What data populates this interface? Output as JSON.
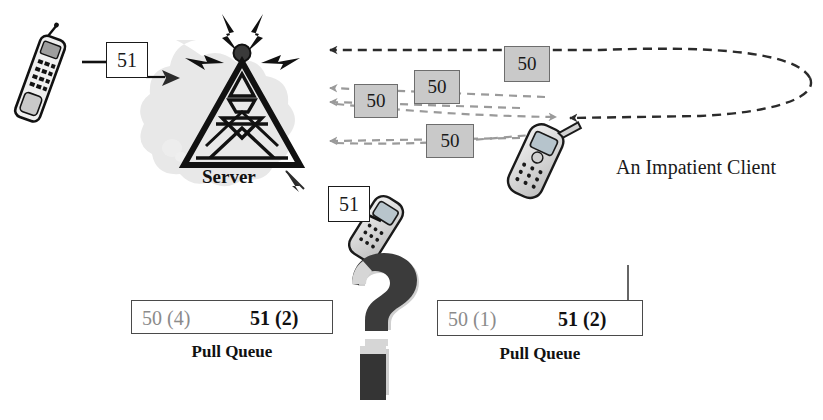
{
  "figure": {
    "background": "#ffffff"
  },
  "colors": {
    "ink": "#111111",
    "gray_text": "#8b8b8b",
    "msg_fill": "#c9c9c9",
    "msg_border": "#6d6d6d",
    "dark_arrow": "#2b2b2b",
    "light_arrow": "#9a9a9a",
    "qmark_face": "#3b3b3b",
    "qmark_edge": "#cfcfcf",
    "cloud": "#e2e2e2",
    "phone_body": "#d8d8d8",
    "phone_outline": "#1a1a1a"
  },
  "server": {
    "label": "Server",
    "icon": "broadcast-tower-icon"
  },
  "client": {
    "label": "An Impatient Client",
    "icon": "mobile-phone-icon"
  },
  "requests": [
    {
      "id": "left-request",
      "value": "51",
      "note": "request sent to server from left handset"
    },
    {
      "id": "lower-request",
      "value": "51",
      "note": "request sent to server from lower handset"
    }
  ],
  "messages": [
    {
      "id": "msg-1",
      "value": "50"
    },
    {
      "id": "msg-2",
      "value": "50"
    },
    {
      "id": "msg-3",
      "value": "50"
    },
    {
      "id": "msg-4",
      "value": "50"
    }
  ],
  "queues": [
    {
      "id": "left-pull-queue",
      "caption": "Pull Queue",
      "entries": [
        {
          "label": "50 (4)",
          "state": "stale"
        },
        {
          "label": "51 (2)",
          "state": "current"
        }
      ]
    },
    {
      "id": "right-pull-queue",
      "caption": "Pull Queue",
      "entries": [
        {
          "label": "50 (1)",
          "state": "stale"
        },
        {
          "label": "51 (2)",
          "state": "current"
        }
      ]
    }
  ],
  "decoration": {
    "question_mark": "?",
    "question_mark_name": "question-mark-icon"
  }
}
